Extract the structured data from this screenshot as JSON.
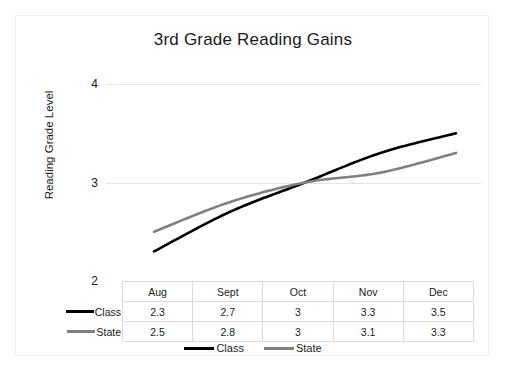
{
  "chart_data": {
    "type": "line",
    "title": "3rd Grade Reading Gains",
    "xlabel": "",
    "ylabel": "Reading Grade Level",
    "categories": [
      "Aug",
      "Sept",
      "Oct",
      "Nov",
      "Dec"
    ],
    "series": [
      {
        "name": "Class",
        "color": "#000000",
        "values": [
          2.3,
          2.7,
          3,
          3.3,
          3.5
        ]
      },
      {
        "name": "State",
        "color": "#808080",
        "values": [
          2.5,
          2.8,
          3,
          3.1,
          3.3
        ]
      }
    ],
    "ylim": [
      2,
      4
    ],
    "yticks": [
      2,
      3,
      4
    ],
    "ytick_labels": [
      "2",
      "3",
      "4"
    ],
    "grid": true,
    "legend_position": "bottom",
    "has_data_table": true
  },
  "table": {
    "corner_label": "",
    "column_headers": [
      "Aug",
      "Sept",
      "Oct",
      "Nov",
      "Dec"
    ],
    "rows": [
      {
        "label": "Class",
        "swatch": "class-color",
        "cells": [
          "2.3",
          "2.7",
          "3",
          "3.3",
          "3.5"
        ]
      },
      {
        "label": "State",
        "swatch": "state-color",
        "cells": [
          "2.5",
          "2.8",
          "3",
          "3.1",
          "3.3"
        ]
      }
    ]
  },
  "legend": {
    "items": [
      {
        "label": "Class",
        "swatch": "class-color"
      },
      {
        "label": "State",
        "swatch": "state-color"
      }
    ]
  },
  "colors": {
    "class": "#000000",
    "state": "#808080",
    "gridline": "#e3e3e3",
    "frame": "#f0f0f0",
    "text": "#1a1a1a"
  }
}
